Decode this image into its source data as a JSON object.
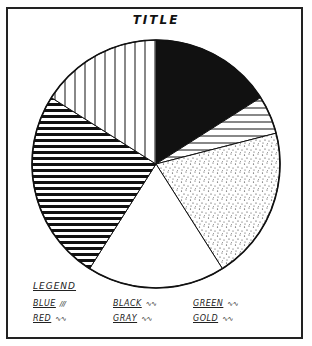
{
  "chart_data": {
    "type": "pie",
    "title": "TITLE",
    "legend_title": "LEGEND",
    "legend_position": "bottom",
    "start_angle_deg": 0,
    "direction": "clockwise",
    "slices": [
      {
        "label": "BLACK",
        "pattern": "solid-black",
        "value": 16
      },
      {
        "label": "GREEN",
        "pattern": "thin-horizontal-lines",
        "value": 5
      },
      {
        "label": "GRAY",
        "pattern": "stipple-dots",
        "value": 20
      },
      {
        "label": "GOLD",
        "pattern": "blank-white",
        "value": 18
      },
      {
        "label": "BLUE",
        "pattern": "thick-horizontal-lines",
        "value": 25
      },
      {
        "label": "RED",
        "pattern": "vertical-lines",
        "value": 16
      }
    ],
    "legend": [
      {
        "label": "BLUE",
        "swatch": "∕∕∕"
      },
      {
        "label": "BLACK",
        "swatch": "∿∿"
      },
      {
        "label": "GREEN",
        "swatch": "∿∿"
      },
      {
        "label": "RED",
        "swatch": "∿∿"
      },
      {
        "label": "GRAY",
        "swatch": "∿∿"
      },
      {
        "label": "GOLD",
        "swatch": "∿∿"
      }
    ]
  },
  "colors": {
    "ink": "#111111",
    "paper": "#ffffff"
  }
}
